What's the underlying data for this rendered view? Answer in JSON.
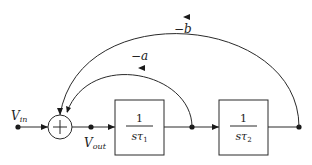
{
  "diagram": {
    "type": "block-diagram",
    "input_label": "V",
    "input_sub": "in",
    "output_label": "V",
    "output_sub": "out",
    "summing_junction_symbol": "+",
    "blocks": [
      {
        "num": "1",
        "den": "sτ",
        "den_sub": "1"
      },
      {
        "num": "1",
        "den": "sτ",
        "den_sub": "2"
      }
    ],
    "feedback": [
      {
        "gain": "−a",
        "from": "block1_output",
        "to": "summing_junction"
      },
      {
        "gain": "−b",
        "from": "block2_output",
        "to": "summing_junction"
      }
    ],
    "colors": {
      "line": "#2a2a2a",
      "background": "#ffffff"
    }
  }
}
